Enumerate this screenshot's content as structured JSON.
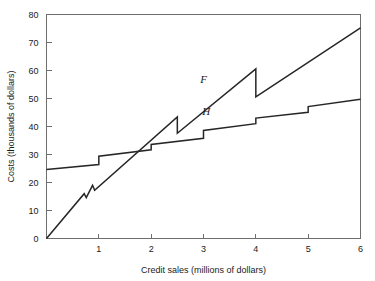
{
  "chart_data": {
    "type": "line",
    "title": "",
    "xlabel": "Credit sales (millions of dollars)",
    "ylabel": "Costs (thousands of dollars)",
    "xlim": [
      0,
      6
    ],
    "ylim": [
      0,
      80
    ],
    "xticks": [
      "1",
      "2",
      "3",
      "4",
      "5",
      "6"
    ],
    "xtick_values": [
      1,
      2,
      3,
      4,
      5,
      6
    ],
    "yticks": [
      "0",
      "10",
      "20",
      "30",
      "40",
      "50",
      "60",
      "70",
      "80"
    ],
    "ytick_values": [
      0,
      10,
      20,
      30,
      40,
      50,
      60,
      70,
      80
    ],
    "grid": false,
    "legend": "inline-labels",
    "series": [
      {
        "name": "F",
        "label": "F",
        "label_x": 3.0,
        "label_y": 55.5,
        "description": "Sawtooth rising cost curve with drops at 0.78, 0.92, 2.5 and 4.0",
        "points": [
          [
            0.0,
            0.0
          ],
          [
            0.72,
            16.0
          ],
          [
            0.76,
            14.6
          ],
          [
            0.88,
            19.0
          ],
          [
            0.92,
            17.2
          ],
          [
            2.5,
            43.4
          ],
          [
            2.5,
            37.6
          ],
          [
            4.0,
            60.6
          ],
          [
            4.0,
            50.6
          ],
          [
            6.0,
            75.2
          ]
        ]
      },
      {
        "name": "H",
        "label": "H",
        "label_x": 3.05,
        "label_y": 44.0,
        "description": "Stepped cost curve with upward steps at 1, 2, 3, 4 and 5",
        "points": [
          [
            0.0,
            24.6
          ],
          [
            1.0,
            26.4
          ],
          [
            1.0,
            29.4
          ],
          [
            2.0,
            31.7
          ],
          [
            2.0,
            33.6
          ],
          [
            3.0,
            35.8
          ],
          [
            3.0,
            38.6
          ],
          [
            4.0,
            41.0
          ],
          [
            4.0,
            43.0
          ],
          [
            5.0,
            45.1
          ],
          [
            5.0,
            47.1
          ],
          [
            6.0,
            49.7
          ]
        ]
      }
    ]
  }
}
